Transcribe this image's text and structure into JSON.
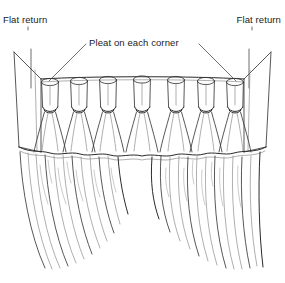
{
  "figure": {
    "kind": "line-drawing",
    "width": 285,
    "height": 283,
    "background_color": "#ffffff",
    "ink_color": "#3a3a3a",
    "ink_color_dark": "#201c1c",
    "ink_color_light": "#8d8d8d"
  },
  "annotations": {
    "flat_return_left": {
      "text": "Flat return",
      "leader": "vertical-line-down"
    },
    "flat_return_right": {
      "text": "Flat return",
      "leader": "vertical-line-down"
    },
    "pleat_on_each_corner": {
      "text": "Pleat on each corner",
      "leader": "two-diagonal-lines-to-corner-pleats"
    }
  },
  "drawing": {
    "pleat_count": 7,
    "rod_y": 79,
    "rod_left_x": 41,
    "rod_right_x": 244,
    "valance_hem_y": 152,
    "panel_bottom_y": 270,
    "return_left": {
      "top_outer_x": 14,
      "top_inner_x": 41,
      "bottom_outer_x": 20,
      "bottom_inner_x": 41
    },
    "return_right": {
      "top_outer_x": 271,
      "top_inner_x": 244,
      "bottom_outer_x": 265,
      "bottom_inner_x": 244
    }
  }
}
